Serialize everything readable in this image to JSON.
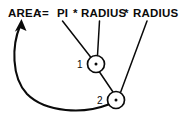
{
  "diagram": {
    "title_expression": "AREA := PI * RADIUS * RADIUS",
    "expression_parts": {
      "target": "AREA",
      "assign": ":=",
      "operand_pi": "PI",
      "operator_1": "*",
      "operand_radius_1": "RADIUS",
      "operator_2": "*",
      "operand_radius_2": "RADIUS"
    },
    "nodes": [
      {
        "id": "1",
        "label": "1",
        "operator": "*",
        "cx": 96,
        "cy": 64,
        "r": 8.5
      },
      {
        "id": "2",
        "label": "2",
        "operator": "*",
        "cx": 116,
        "cy": 100,
        "r": 8.5
      }
    ],
    "edges": [
      {
        "name": "pi-to-node1",
        "from": "PI",
        "to": "1"
      },
      {
        "name": "radius1-to-node1",
        "from": "RADIUS",
        "to": "1"
      },
      {
        "name": "node1-to-node2",
        "from": "1",
        "to": "2"
      },
      {
        "name": "radius2-to-node2",
        "from": "RADIUS",
        "to": "2"
      },
      {
        "name": "node2-to-area",
        "from": "2",
        "to": "AREA"
      }
    ],
    "colors": {
      "ink": "#0a0a0a",
      "background": "#ffffff"
    }
  }
}
